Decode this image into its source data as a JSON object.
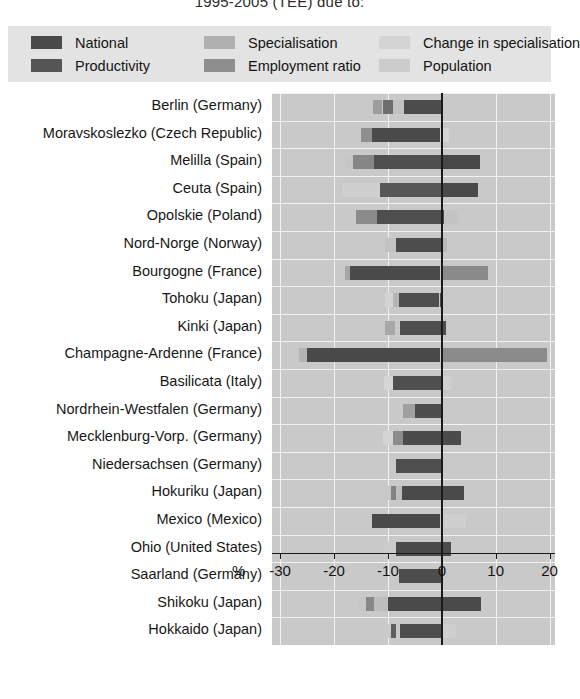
{
  "title": "1995-2005 (TEE) due to:",
  "legend": {
    "items": [
      {
        "label": "National",
        "color": "#4a4a4a",
        "icon": "legend-swatch"
      },
      {
        "label": "Specialisation",
        "color": "#b0b0b0",
        "icon": "legend-swatch"
      },
      {
        "label": "Change in specialisation",
        "color": "#d4d4d4",
        "icon": "legend-swatch"
      },
      {
        "label": "Productivity",
        "color": "#555555",
        "icon": "legend-swatch"
      },
      {
        "label": "Employment ratio",
        "color": "#8e8e8e",
        "icon": "legend-swatch"
      },
      {
        "label": "Population",
        "color": "#cccccc",
        "icon": "legend-swatch"
      }
    ]
  },
  "axis": {
    "unit_label": "%",
    "ticks": [
      -30,
      -20,
      -10,
      0,
      10,
      20
    ],
    "tick_labels": [
      "-30",
      "-20",
      "-10",
      "0",
      "10",
      "20"
    ],
    "min": -31.5,
    "max": 21.0
  },
  "chart_data": {
    "type": "bar",
    "orientation": "horizontal",
    "stacked": true,
    "title": "1995-2005 (TEE) due to:",
    "xlabel": "%",
    "ylabel": "",
    "xlim": [
      -31.5,
      21.0
    ],
    "grid": true,
    "legend_position": "top",
    "series_names": [
      "National",
      "Productivity",
      "Specialisation",
      "Employment ratio",
      "Change in specialisation",
      "Population"
    ],
    "series_colors": [
      "#4a4a4a",
      "#555555",
      "#b0b0b0",
      "#8e8e8e",
      "#d4d4d4",
      "#cccccc"
    ],
    "categories": [
      "Berlin (Germany)",
      "Moravskoslezko (Czech Republic)",
      "Melilla  (Spain)",
      "Ceuta (Spain)",
      "Opolskie (Poland)",
      "Nord-Norge (Norway)",
      "Bourgogne (France)",
      "Tohoku (Japan)",
      "Kinki (Japan)",
      "Champagne-Ardenne (France)",
      "Basilicata (Italy)",
      "Nordrhein-Westfalen (Germany)",
      "Mecklenburg-Vorp. (Germany)",
      "Niedersachsen (Germany)",
      "Hokuriku (Japan)",
      "Mexico (Mexico)",
      "Ohio (United States)",
      "Saarland (Germany)",
      "Shikoku (Japan)",
      "Hokkaido (Japan)"
    ],
    "rows": [
      {
        "category": "Berlin (Germany)",
        "segments": [
          {
            "series": "Specialisation",
            "start": -12.7,
            "end": -11.0,
            "color": "#9e9e9e"
          },
          {
            "series": "Employment ratio",
            "start": -11.0,
            "end": -9.0,
            "color": "#6e6e6e"
          },
          {
            "series": "Change in specialisation",
            "start": -9.0,
            "end": -7.0,
            "color": "#c2c2c2"
          },
          {
            "series": "Productivity",
            "start": -7.0,
            "end": -0.1,
            "color": "#4c4c4c"
          }
        ]
      },
      {
        "category": "Moravskoslezko (Czech Republic)",
        "segments": [
          {
            "series": "Specialisation",
            "start": -15.0,
            "end": -13.0,
            "color": "#8f8f8f"
          },
          {
            "series": "National",
            "start": -13.0,
            "end": -0.3,
            "color": "#4a4a4a"
          },
          {
            "series": "Population",
            "start": -0.3,
            "end": 1.4,
            "color": "#d6d6d6"
          }
        ]
      },
      {
        "category": "Melilla  (Spain)",
        "segments": [
          {
            "series": "Change in specialisation",
            "start": -18.0,
            "end": -16.5,
            "color": "#c6c6c6"
          },
          {
            "series": "Employment ratio",
            "start": -16.5,
            "end": -12.5,
            "color": "#868686"
          },
          {
            "series": "Productivity",
            "start": -12.5,
            "end": -0.2,
            "color": "#4f4f4f"
          },
          {
            "series": "National",
            "start": 0.1,
            "end": 7.0,
            "color": "#474747"
          }
        ]
      },
      {
        "category": "Ceuta (Spain)",
        "segments": [
          {
            "series": "Change in specialisation",
            "start": -18.5,
            "end": -11.5,
            "color": "#cfcfcf"
          },
          {
            "series": "Productivity",
            "start": -11.5,
            "end": -0.2,
            "color": "#575757"
          },
          {
            "series": "National",
            "start": 0.1,
            "end": 6.8,
            "color": "#4a4a4a"
          }
        ]
      },
      {
        "category": "Opolskie (Poland)",
        "segments": [
          {
            "series": "Specialisation",
            "start": -16.0,
            "end": -12.0,
            "color": "#8b8b8b"
          },
          {
            "series": "Productivity",
            "start": -12.0,
            "end": 0.5,
            "color": "#4e4e4e"
          },
          {
            "series": "Change in specialisation",
            "start": 0.5,
            "end": 3.0,
            "color": "#c4c4c4"
          }
        ]
      },
      {
        "category": "Nord-Norge (Norway)",
        "segments": [
          {
            "series": "Change in specialisation",
            "start": -10.5,
            "end": -8.5,
            "color": "#c2c2c2"
          },
          {
            "series": "Productivity",
            "start": -8.5,
            "end": -0.1,
            "color": "#4d4d4d"
          },
          {
            "series": "Population",
            "start": 0.2,
            "end": 1.0,
            "color": "#b8b8b8"
          }
        ]
      },
      {
        "category": "Bourgogne (France)",
        "segments": [
          {
            "series": "Specialisation",
            "start": -18.0,
            "end": -17.0,
            "color": "#a6a6a6"
          },
          {
            "series": "National",
            "start": -17.0,
            "end": -0.4,
            "color": "#4a4a4a"
          },
          {
            "series": "Employment ratio",
            "start": 0.1,
            "end": 8.6,
            "color": "#8a8a8a"
          }
        ]
      },
      {
        "category": "Tohoku (Japan)",
        "segments": [
          {
            "series": "Change in specialisation",
            "start": -10.5,
            "end": -9.0,
            "color": "#d3d3d3"
          },
          {
            "series": "Specialisation",
            "start": -9.0,
            "end": -8.0,
            "color": "#b5b5b5"
          },
          {
            "series": "Productivity",
            "start": -8.0,
            "end": -0.6,
            "color": "#4f4f4f"
          },
          {
            "series": "Population",
            "start": -0.4,
            "end": 0.3,
            "color": "#4a4a4a"
          }
        ]
      },
      {
        "category": "Kinki (Japan)",
        "segments": [
          {
            "series": "Change in specialisation",
            "start": -10.5,
            "end": -8.6,
            "color": "#a8a8a8"
          },
          {
            "series": "Productivity",
            "start": -7.8,
            "end": 0.7,
            "color": "#4e4e4e"
          }
        ]
      },
      {
        "category": "Champagne-Ardenne (France)",
        "segments": [
          {
            "series": "Specialisation",
            "start": -26.5,
            "end": -25.0,
            "color": "#b3b3b3"
          },
          {
            "series": "National",
            "start": -25.0,
            "end": -0.4,
            "color": "#494949"
          },
          {
            "series": "Employment ratio",
            "start": 0.1,
            "end": 19.5,
            "color": "#8b8b8b"
          }
        ]
      },
      {
        "category": "Basilicata (Italy)",
        "segments": [
          {
            "series": "Change in specialisation",
            "start": -10.8,
            "end": -9.0,
            "color": "#d6d6d6"
          },
          {
            "series": "Productivity",
            "start": -9.0,
            "end": -0.1,
            "color": "#4f4f4f"
          },
          {
            "series": "Population",
            "start": 0.2,
            "end": 1.8,
            "color": "#d0d0d0"
          }
        ]
      },
      {
        "category": "Nordrhein-Westfalen (Germany)",
        "segments": [
          {
            "series": "Specialisation",
            "start": -7.2,
            "end": -5.0,
            "color": "#a0a0a0"
          },
          {
            "series": "Productivity",
            "start": -5.0,
            "end": -0.1,
            "color": "#4d4d4d"
          }
        ]
      },
      {
        "category": "Mecklenburg-Vorp. (Germany)",
        "segments": [
          {
            "series": "Change in specialisation",
            "start": -11.0,
            "end": -9.0,
            "color": "#d4d4d4"
          },
          {
            "series": "Employment ratio",
            "start": -9.0,
            "end": -7.2,
            "color": "#8c8c8c"
          },
          {
            "series": "National",
            "start": -7.2,
            "end": 3.6,
            "color": "#4b4b4b"
          }
        ]
      },
      {
        "category": "Niedersachsen (Germany)",
        "segments": [
          {
            "series": "Productivity",
            "start": -8.5,
            "end": -0.2,
            "color": "#4e4e4e"
          },
          {
            "series": "Population",
            "start": 0.2,
            "end": 1.0,
            "color": "#c6c6c6"
          }
        ]
      },
      {
        "category": "Hokuriku (Japan)",
        "segments": [
          {
            "series": "Change in specialisation",
            "start": -11.3,
            "end": -9.5,
            "color": "#c8c8c8"
          },
          {
            "series": "Employment ratio",
            "start": -9.5,
            "end": -8.5,
            "color": "#828282"
          },
          {
            "series": "Specialisation",
            "start": -8.5,
            "end": -7.4,
            "color": "#bdbdbd"
          },
          {
            "series": "National",
            "start": -7.4,
            "end": 4.2,
            "color": "#4a4a4a"
          }
        ]
      },
      {
        "category": "Mexico (Mexico)",
        "segments": [
          {
            "series": "National",
            "start": -13.0,
            "end": -0.3,
            "color": "#4a4a4a"
          },
          {
            "series": "Population",
            "start": 0.3,
            "end": 4.5,
            "color": "#cfcfcf"
          }
        ]
      },
      {
        "category": "Ohio (United States)",
        "segments": [
          {
            "series": "Change in specialisation",
            "start": -11.0,
            "end": -8.5,
            "color": "#cbcbcb"
          },
          {
            "series": "National",
            "start": -8.5,
            "end": 1.8,
            "color": "#4b4b4b"
          }
        ]
      },
      {
        "category": "Saarland (Germany)",
        "segments": [
          {
            "series": "Change in specialisation",
            "start": -9.8,
            "end": -8.0,
            "color": "#c9c9c9"
          },
          {
            "series": "Productivity",
            "start": -8.0,
            "end": -0.1,
            "color": "#4d4d4d"
          }
        ]
      },
      {
        "category": "Shikoku (Japan)",
        "segments": [
          {
            "series": "Change in specialisation",
            "start": -15.5,
            "end": -14.0,
            "color": "#c7c7c7"
          },
          {
            "series": "Employment ratio",
            "start": -14.0,
            "end": -12.5,
            "color": "#878787"
          },
          {
            "series": "Specialisation",
            "start": -12.5,
            "end": -10.0,
            "color": "#bdbdbd"
          },
          {
            "series": "National",
            "start": -10.0,
            "end": 7.3,
            "color": "#4a4a4a"
          }
        ]
      },
      {
        "category": "Hokkaido (Japan)",
        "segments": [
          {
            "series": "Change in specialisation",
            "start": -11.0,
            "end": -9.5,
            "color": "#cacaca"
          },
          {
            "series": "Employment ratio",
            "start": -9.5,
            "end": -8.5,
            "color": "#5e5e5e"
          },
          {
            "series": "Productivity",
            "start": -7.8,
            "end": -0.2,
            "color": "#4d4d4d"
          },
          {
            "series": "Population",
            "start": 0.2,
            "end": 2.6,
            "color": "#cfcfcf"
          }
        ]
      }
    ]
  }
}
